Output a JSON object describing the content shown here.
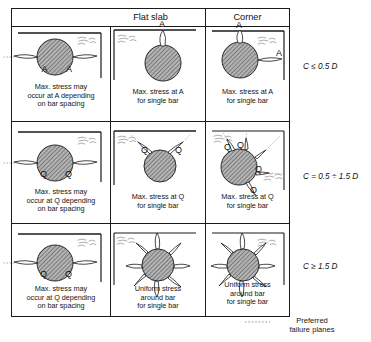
{
  "figure": {
    "type": "technical-diagram",
    "headers": [
      {
        "id": "flat-slab",
        "label": "Flat slab",
        "span": 2
      },
      {
        "id": "corner",
        "label": "Corner",
        "span": 1
      }
    ],
    "row_labels": [
      {
        "id": "row-1",
        "symbol": "C",
        "relation": "≤",
        "value": "0.5",
        "unit": "D",
        "text": "C ≤ 0.5 D"
      },
      {
        "id": "row-2",
        "symbol": "C",
        "relation": "=",
        "value": "0.5 ÷ 1.5",
        "unit": "D",
        "text": "C = 0.5 ÷ 1.5 D"
      },
      {
        "id": "row-3",
        "symbol": "C",
        "relation": "≥",
        "value": "1.5",
        "unit": "D",
        "text": "C ≥ 1.5 D"
      }
    ],
    "cells": [
      {
        "id": "cell-r1c1",
        "row": 1,
        "col": 1,
        "group": "Flat slab",
        "point_labels": [
          "A",
          "A"
        ],
        "caption": [
          "Max. stress may",
          "occur at A depending",
          "on bar spacing"
        ],
        "geometry": "two horizontal failure planes, bar near top surface, corner edge at right"
      },
      {
        "id": "cell-r1c2",
        "row": 1,
        "col": 2,
        "group": "Flat slab",
        "point_labels": [
          "A"
        ],
        "caption": [
          "Max. stress at A",
          "for single bar"
        ],
        "geometry": "single vertical failure plane to top surface"
      },
      {
        "id": "cell-r1c3",
        "row": 1,
        "col": 3,
        "group": "Corner",
        "point_labels": [
          "A",
          "A"
        ],
        "caption": [
          "Max. stress at A",
          "for single bar"
        ],
        "geometry": "vertical and horizontal failure planes at corner"
      },
      {
        "id": "cell-r2c1",
        "row": 2,
        "col": 1,
        "group": "Flat slab",
        "point_labels": [
          "Q",
          "Q"
        ],
        "caption": [
          "Max. stress may",
          "occur at Q depending",
          "on bar spacing"
        ],
        "geometry": "two horizontal failure planes, bar deeper below surface"
      },
      {
        "id": "cell-r2c2",
        "row": 2,
        "col": 2,
        "group": "Flat slab",
        "point_labels": [
          "Q",
          "Q"
        ],
        "caption": [
          "Max. stress at Q",
          "for single bar"
        ],
        "geometry": "two inclined failure planes fanning to top surface"
      },
      {
        "id": "cell-r2c3",
        "row": 2,
        "col": 3,
        "group": "Corner",
        "point_labels": [
          "Q",
          "Q",
          "Q",
          "Q"
        ],
        "caption": [
          "Max. stress at Q",
          "for single bar"
        ],
        "geometry": "four inclined failure planes fanning toward corner faces"
      },
      {
        "id": "cell-r3c1",
        "row": 3,
        "col": 1,
        "group": "Flat slab",
        "point_labels": [
          "Q",
          "Q"
        ],
        "caption": [
          "Max. stress may",
          "occur at Q depending",
          "on bar spacing"
        ],
        "geometry": "two horizontal failure planes, deep cover"
      },
      {
        "id": "cell-r3c2",
        "row": 3,
        "col": 2,
        "group": "Flat slab",
        "point_labels": [],
        "caption": [
          "Uniform stress",
          "around bar",
          "for single bar"
        ],
        "geometry": "radial starburst of failure planes around bar"
      },
      {
        "id": "cell-r3c3",
        "row": 3,
        "col": 3,
        "group": "Corner",
        "point_labels": [],
        "caption": [
          "Uniform stress",
          "around bar",
          "for single bar"
        ],
        "geometry": "radial starburst of failure planes around bar near corner"
      }
    ],
    "legend": {
      "id": "legend-preferred-failure-planes",
      "line_style": "dotted",
      "text": [
        "Preferred",
        "failure planes"
      ]
    },
    "colors": {
      "stroke": "#1a1a1a",
      "bar_fill": "#9a9a9a",
      "background": "#ffffff",
      "dotted": "#7a7a7a"
    }
  }
}
